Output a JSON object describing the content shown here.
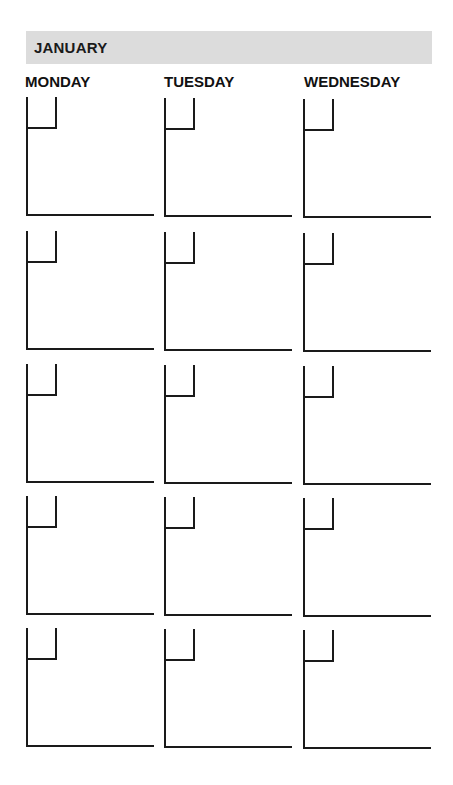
{
  "month": {
    "label": "JANUARY",
    "bar_color": "#dcdcdc"
  },
  "days": [
    {
      "label": "MONDAY",
      "x": 25
    },
    {
      "label": "TUESDAY",
      "x": 164
    },
    {
      "label": "WEDNESDAY",
      "x": 304
    }
  ],
  "grid": {
    "rows": 5,
    "columns": 3,
    "row_tops": [
      97,
      231,
      364,
      496,
      628
    ],
    "column_lefts": [
      26,
      164,
      303
    ]
  }
}
